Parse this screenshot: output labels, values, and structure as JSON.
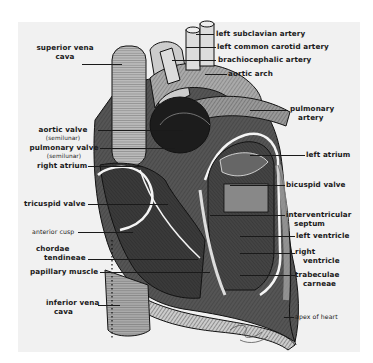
{
  "figure": {
    "background_color": "#f1f1f1",
    "ink_color": "#1a1a1a"
  },
  "labels": {
    "left_subclavian_artery": "left subclavian artery",
    "left_common_carotid_artery": "left common carotid artery",
    "brachiocephalic_artery": "brachiocephalic artery",
    "aortic_arch": "aortic arch",
    "superior_vena_cava_1": "superior vena",
    "superior_vena_cava_2": "cava",
    "pulmonary_artery_1": "pulmonary",
    "pulmonary_artery_2": "artery",
    "aortic_valve": "aortic valve",
    "aortic_valve_sub": "(semilunar)",
    "pulmonary_valve": "pulmonary valve",
    "pulmonary_valve_sub": "(semilunar)",
    "left_atrium": "left atrium",
    "right_atrium": "right atrium",
    "bicuspid_valve": "bicuspid valve",
    "tricuspid_valve": "tricuspid valve",
    "interventricular_septum_1": "interventricular",
    "interventricular_septum_2": "septum",
    "anterior_cusp": "anterior cusp",
    "left_ventricle": "left ventricle",
    "chordae_tendineae_1": "chordae",
    "chordae_tendineae_2": "tendineae",
    "right_ventricle_1": "right",
    "right_ventricle_2": "ventricle",
    "papillary_muscle": "papillary muscle",
    "trabeculae_carneae_1": "trabeculae",
    "trabeculae_carneae_2": "carneae",
    "inferior_vena_cava_1": "inferior vena",
    "inferior_vena_cava_2": "cava",
    "apex_of_heart": "apex of heart"
  }
}
